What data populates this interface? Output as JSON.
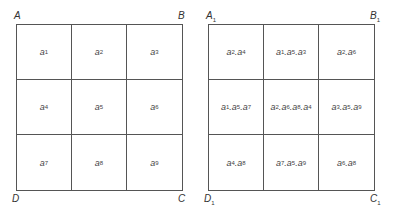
{
  "left_grid": {
    "corners": {
      "top_left": "A",
      "top_right": "B",
      "bottom_right": "C",
      "bottom_left": "D"
    },
    "cells": [
      {
        "base": "a",
        "sub": "1"
      },
      {
        "base": "a",
        "sub": "2"
      },
      {
        "base": "a",
        "sub": "3"
      },
      {
        "base": "a",
        "sub": "4"
      },
      {
        "base": "a",
        "sub": "5"
      },
      {
        "base": "a",
        "sub": "6"
      },
      {
        "base": "a",
        "sub": "7"
      },
      {
        "base": "a",
        "sub": "8"
      },
      {
        "base": "a",
        "sub": "9"
      }
    ]
  },
  "right_grid": {
    "corners": {
      "top_left": {
        "base": "A",
        "sub": "1"
      },
      "top_right": {
        "base": "B",
        "sub": "1"
      },
      "bottom_right": {
        "base": "C",
        "sub": "1"
      },
      "bottom_left": {
        "base": "D",
        "sub": "1"
      }
    },
    "cells": [
      {
        "terms": [
          "2",
          "4"
        ]
      },
      {
        "terms": [
          "1",
          "5",
          "3"
        ]
      },
      {
        "terms": [
          "2",
          "6"
        ]
      },
      {
        "terms": [
          "1",
          "5",
          "7"
        ]
      },
      {
        "terms": [
          "2",
          "6",
          "8",
          "4"
        ]
      },
      {
        "terms": [
          "3",
          "5",
          "9"
        ]
      },
      {
        "terms": [
          "4",
          "8"
        ]
      },
      {
        "terms": [
          "7",
          "5",
          "9"
        ]
      },
      {
        "terms": [
          "6",
          "8"
        ]
      }
    ]
  }
}
